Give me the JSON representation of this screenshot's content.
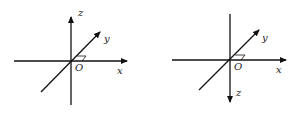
{
  "diagrams": [
    {
      "name": "right-handed coordinate system (z up)",
      "labels": {
        "x": "x",
        "y": "y",
        "z": "z",
        "origin": "O"
      }
    },
    {
      "name": "coordinate system (z down)",
      "labels": {
        "x": "x",
        "y": "y",
        "z": "z",
        "origin": "O"
      }
    }
  ],
  "colors": {
    "stroke": "#111111",
    "background": "#ffffff"
  }
}
